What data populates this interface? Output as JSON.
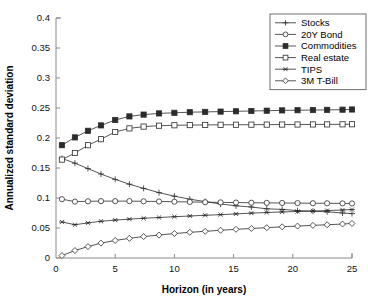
{
  "chart_data": {
    "type": "line",
    "title": "",
    "xlabel": "Horizon (in years)",
    "ylabel": "Annualized standard deviation",
    "xlim": [
      0,
      25
    ],
    "ylim": [
      0,
      0.4
    ],
    "xticks": [
      0,
      5,
      10,
      15,
      20,
      25
    ],
    "xtick_labels": [
      "0",
      "5",
      "10",
      "15",
      "20",
      "25"
    ],
    "yticks": [
      0,
      0.05,
      0.1,
      0.15,
      0.2,
      0.25,
      0.3,
      0.35,
      0.4
    ],
    "ytick_labels": [
      "0",
      "0.05",
      "0.1",
      "0.15",
      "0.2",
      "0.25",
      "0.3",
      "0.35",
      "0.4"
    ],
    "grid": false,
    "legend_position": "top-right",
    "x": [
      0.5,
      1.6,
      2.7,
      3.8,
      5.0,
      6.2,
      7.4,
      8.7,
      10.0,
      11.3,
      12.6,
      13.9,
      15.2,
      16.5,
      17.8,
      19.1,
      20.4,
      21.7,
      22.9,
      24.2,
      25.0
    ],
    "series": [
      {
        "name": "Stocks",
        "marker": "plus",
        "values": [
          0.166,
          0.158,
          0.149,
          0.14,
          0.131,
          0.123,
          0.116,
          0.109,
          0.103,
          0.098,
          0.094,
          0.09,
          0.087,
          0.085,
          0.082,
          0.081,
          0.079,
          0.078,
          0.077,
          0.075,
          0.074
        ]
      },
      {
        "name": "20Y Bond",
        "marker": "circle-open",
        "values": [
          0.098,
          0.094,
          0.0945,
          0.0948,
          0.0948,
          0.0948,
          0.0945,
          0.0942,
          0.0938,
          0.0934,
          0.093,
          0.0927,
          0.0924,
          0.0921,
          0.0919,
          0.0917,
          0.0915,
          0.0913,
          0.0912,
          0.091,
          0.0909
        ]
      },
      {
        "name": "Commodities",
        "marker": "square-filled",
        "values": [
          0.188,
          0.201,
          0.212,
          0.221,
          0.23,
          0.236,
          0.239,
          0.241,
          0.242,
          0.243,
          0.2435,
          0.244,
          0.2445,
          0.245,
          0.2455,
          0.246,
          0.2463,
          0.2466,
          0.2469,
          0.2472,
          0.2475
        ]
      },
      {
        "name": "Real estate",
        "marker": "square-open",
        "values": [
          0.164,
          0.175,
          0.188,
          0.198,
          0.21,
          0.216,
          0.219,
          0.2205,
          0.2212,
          0.2215,
          0.2218,
          0.222,
          0.2221,
          0.2222,
          0.2223,
          0.2224,
          0.2225,
          0.2226,
          0.2227,
          0.2228,
          0.2229
        ]
      },
      {
        "name": "TIPS",
        "marker": "asterisk",
        "values": [
          0.06,
          0.0555,
          0.0585,
          0.0612,
          0.0632,
          0.0648,
          0.0662,
          0.0675,
          0.0688,
          0.07,
          0.0712,
          0.0722,
          0.0735,
          0.0748,
          0.0758,
          0.0768,
          0.0775,
          0.0782,
          0.079,
          0.08,
          0.0808
        ]
      },
      {
        "name": "3M T-Bill",
        "marker": "diamond-open",
        "values": [
          0.004,
          0.0125,
          0.019,
          0.0248,
          0.0292,
          0.0328,
          0.0358,
          0.0382,
          0.0408,
          0.0428,
          0.0445,
          0.0462,
          0.0478,
          0.0492,
          0.0505,
          0.052,
          0.0532,
          0.0544,
          0.0554,
          0.0566,
          0.0576
        ]
      }
    ]
  },
  "legend": {
    "entries": [
      {
        "label": "Stocks"
      },
      {
        "label": "20Y Bond"
      },
      {
        "label": "Commodities"
      },
      {
        "label": "Real estate"
      },
      {
        "label": "TIPS"
      },
      {
        "label": "3M T-Bill"
      }
    ]
  },
  "colors": {
    "line": "#2b2b2b",
    "axis": "#8a8a8a",
    "text": "#000000",
    "background": "#ffffff"
  }
}
